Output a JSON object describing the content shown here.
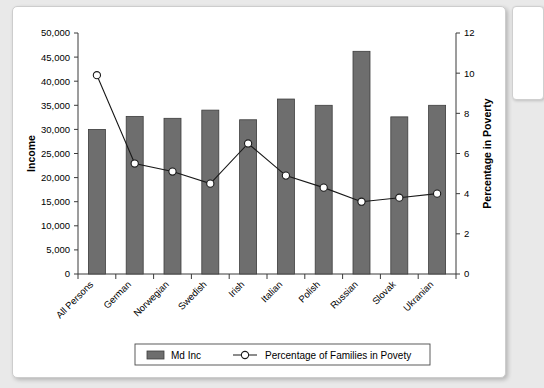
{
  "chart_data": {
    "type": "bar",
    "title": "",
    "subtitle": "",
    "categories": [
      "All Persons",
      "German",
      "Norwegian",
      "Swedish",
      "Irish",
      "Italian",
      "Polish",
      "Russian",
      "Slovak",
      "Ukranian"
    ],
    "xlabel": "",
    "ylabel": "Income",
    "ylim": [
      0,
      50000
    ],
    "yticks": [
      "0",
      "5,000",
      "10,000",
      "15,000",
      "20,000",
      "25,000",
      "30,000",
      "35,000",
      "40,000",
      "45,000",
      "50,000"
    ],
    "ytick_values": [
      0,
      5000,
      10000,
      15000,
      20000,
      25000,
      30000,
      35000,
      40000,
      45000,
      50000
    ],
    "y2label": "Percentage in Poverty",
    "y2lim": [
      0,
      12
    ],
    "y2ticks": [
      "0",
      "2",
      "4",
      "6",
      "8",
      "10",
      "12"
    ],
    "y2tick_values": [
      0,
      2,
      4,
      6,
      8,
      10,
      12
    ],
    "grid": false,
    "legend_position": "bottom",
    "series": [
      {
        "name": "Md Inc",
        "type": "bar",
        "axis": "left",
        "values": [
          30000,
          32700,
          32300,
          34000,
          32000,
          36300,
          35000,
          46200,
          32600,
          35000
        ]
      },
      {
        "name": "Percentage of Families in Povety",
        "type": "line",
        "axis": "right",
        "values": [
          9.9,
          5.5,
          5.1,
          4.5,
          6.5,
          4.9,
          4.3,
          3.6,
          3.8,
          4.0
        ]
      }
    ]
  },
  "legend": {
    "items": [
      {
        "label": "Md Inc",
        "marker": "bar-swatch"
      },
      {
        "label": "Percentage of Families in Povety",
        "marker": "line-open-circle"
      }
    ]
  }
}
